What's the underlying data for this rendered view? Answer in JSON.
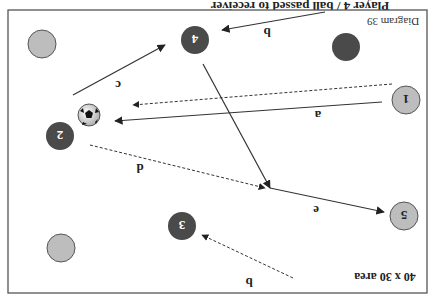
{
  "diagram": {
    "orientation": "rotated-180",
    "header_text_cut": "Player 4 / ball passed to receiver",
    "diagram_label": "Diagram 39",
    "area_label": "40 x 30 area",
    "colors": {
      "frame": "#555555",
      "dark_player": "#4a4a4a",
      "light_player": "#bdbdbd",
      "line": "#333333"
    },
    "players": [
      {
        "id": "p-top-left",
        "label": "",
        "team": "light",
        "x": 42,
        "y": 44
      },
      {
        "id": "p4",
        "label": "4",
        "team": "dark",
        "x": 195,
        "y": 40
      },
      {
        "id": "p-top-right",
        "label": "",
        "team": "dark",
        "x": 346,
        "y": 47
      },
      {
        "id": "p1",
        "label": "1",
        "team": "light",
        "x": 406,
        "y": 100
      },
      {
        "id": "p2",
        "label": "2",
        "team": "dark",
        "x": 60,
        "y": 136
      },
      {
        "id": "p5",
        "label": "5",
        "team": "light",
        "x": 404,
        "y": 216
      },
      {
        "id": "p3",
        "label": "3",
        "team": "dark",
        "x": 182,
        "y": 226
      },
      {
        "id": "p-bottom-left",
        "label": "",
        "team": "light",
        "x": 61,
        "y": 248
      }
    ],
    "ball": {
      "x": 89,
      "y": 115
    },
    "arrows": [
      {
        "label": "b",
        "style": "solid",
        "from": [
          325,
          12
        ],
        "to": [
          222,
          30
        ],
        "label_pos": [
          267,
          32
        ]
      },
      {
        "label": "c",
        "style": "solid",
        "from": [
          73,
          95
        ],
        "to": [
          165,
          45
        ],
        "label_pos": [
          118,
          85
        ]
      },
      {
        "label": "",
        "style": "solid",
        "from": [
          203,
          64
        ],
        "to": [
          270,
          188
        ]
      },
      {
        "label": "a",
        "style": "dotted",
        "from": [
          392,
          84
        ],
        "to": [
          133,
          105
        ]
      },
      {
        "label": "a",
        "style": "solid",
        "from": [
          382,
          102
        ],
        "to": [
          115,
          121
        ],
        "label_pos": [
          318,
          115
        ]
      },
      {
        "label": "d",
        "style": "dotted",
        "from": [
          90,
          145
        ],
        "to": [
          265,
          188
        ],
        "label_pos": [
          140,
          168
        ]
      },
      {
        "label": "e",
        "style": "solid",
        "from": [
          270,
          188
        ],
        "to": [
          384,
          212
        ],
        "label_pos": [
          316,
          210
        ]
      },
      {
        "label": "b",
        "style": "dotted",
        "from": [
          293,
          278
        ],
        "to": [
          202,
          235
        ],
        "label_pos": [
          249,
          282
        ]
      }
    ]
  }
}
